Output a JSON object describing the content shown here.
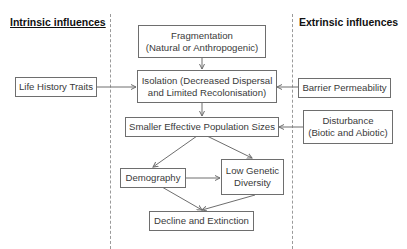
{
  "headers": {
    "intrinsic": "Intrinsic influences",
    "extrinsic": "Extrinsic influences"
  },
  "nodes": {
    "fragmentation": {
      "line1": "Fragmentation",
      "line2": "(Natural or Anthropogenic)"
    },
    "isolation": {
      "line1": "Isolation (Decreased Dispersal",
      "line2": "and Limited Recolonisation)"
    },
    "life_history": {
      "label": "Life History Traits"
    },
    "barrier": {
      "label": "Barrier Permeability"
    },
    "smaller_pop": {
      "label": "Smaller Effective Population Sizes"
    },
    "disturbance": {
      "line1": "Disturbance",
      "line2": "(Biotic and Abiotic)"
    },
    "demography": {
      "label": "Demography"
    },
    "low_genetic": {
      "line1": "Low Genetic",
      "line2": "Diversity"
    },
    "decline": {
      "label": "Decline and Extinction"
    }
  },
  "edges": [
    {
      "from": "Fragmentation",
      "to": "Isolation"
    },
    {
      "from": "Life History Traits",
      "to": "Isolation"
    },
    {
      "from": "Barrier Permeability",
      "to": "Isolation"
    },
    {
      "from": "Isolation",
      "to": "Smaller Effective Population Sizes"
    },
    {
      "from": "Disturbance",
      "to": "Smaller Effective Population Sizes"
    },
    {
      "from": "Smaller Effective Population Sizes",
      "to": "Demography"
    },
    {
      "from": "Smaller Effective Population Sizes",
      "to": "Low Genetic Diversity"
    },
    {
      "from": "Demography",
      "to": "Low Genetic Diversity"
    },
    {
      "from": "Demography",
      "to": "Decline and Extinction"
    },
    {
      "from": "Low Genetic Diversity",
      "to": "Decline and Extinction"
    }
  ],
  "colors": {
    "line": "#6e6e6e",
    "text": "#3a3a3a",
    "header": "#111111"
  }
}
